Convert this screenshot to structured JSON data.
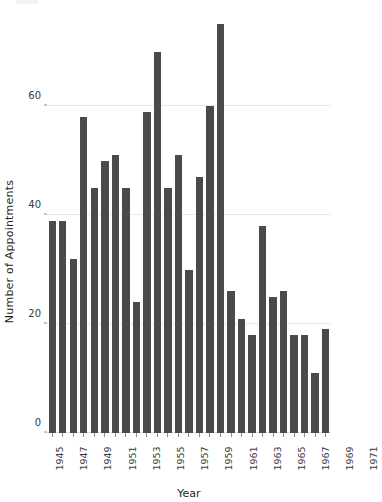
{
  "chart_data": {
    "type": "bar",
    "title": "",
    "xlabel": "Year",
    "ylabel": "Number of Appointments",
    "ylim": [
      0,
      78
    ],
    "yticks": [
      0,
      20,
      40,
      60
    ],
    "grid": true,
    "legend": null,
    "bar_color": "#4a4a4a",
    "categories": [
      "1945",
      "1946",
      "1947",
      "1948",
      "1949",
      "1950",
      "1951",
      "1952",
      "1953",
      "1954",
      "1955",
      "1956",
      "1957",
      "1958",
      "1959",
      "1960",
      "1961",
      "1962",
      "1963",
      "1964",
      "1965",
      "1966",
      "1967",
      "1968",
      "1969",
      "1970",
      "1971"
    ],
    "values": [
      39,
      39,
      32,
      58,
      45,
      50,
      51,
      45,
      24,
      59,
      70,
      45,
      51,
      30,
      47,
      60,
      75,
      26,
      21,
      18,
      38,
      25,
      26,
      18,
      18,
      11,
      19
    ],
    "xtick_labels_shown": [
      "1945",
      "",
      "1947",
      "",
      "1949",
      "",
      "1951",
      "",
      "1953",
      "",
      "1955",
      "",
      "1957",
      "",
      "1959",
      "",
      "1961",
      "",
      "1963",
      "",
      "1965",
      "",
      "1967",
      "",
      "1969",
      "",
      "1971"
    ]
  }
}
